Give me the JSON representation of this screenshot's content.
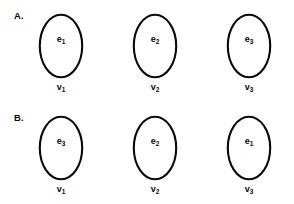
{
  "figure": {
    "background_color": "#ffffff",
    "stroke_color": "#0a0a0a",
    "text_color": "#0a0a0a",
    "panels": [
      {
        "panel_label": "A.",
        "nodes": [
          {
            "shape": "ellipse",
            "edge_letter": "e",
            "edge_subscript": "1",
            "vertex_letter": "v",
            "vertex_subscript": "1"
          },
          {
            "shape": "ellipse",
            "edge_letter": "e",
            "edge_subscript": "2",
            "vertex_letter": "v",
            "vertex_subscript": "2"
          },
          {
            "shape": "ellipse",
            "edge_letter": "e",
            "edge_subscript": "3",
            "vertex_letter": "v",
            "vertex_subscript": "3"
          }
        ]
      },
      {
        "panel_label": "B.",
        "nodes": [
          {
            "shape": "ellipse",
            "edge_letter": "e",
            "edge_subscript": "3",
            "vertex_letter": "v",
            "vertex_subscript": "1"
          },
          {
            "shape": "ellipse",
            "edge_letter": "e",
            "edge_subscript": "2",
            "vertex_letter": "v",
            "vertex_subscript": "2"
          },
          {
            "shape": "ellipse",
            "edge_letter": "e",
            "edge_subscript": "1",
            "vertex_letter": "v",
            "vertex_subscript": "3"
          }
        ]
      }
    ]
  }
}
